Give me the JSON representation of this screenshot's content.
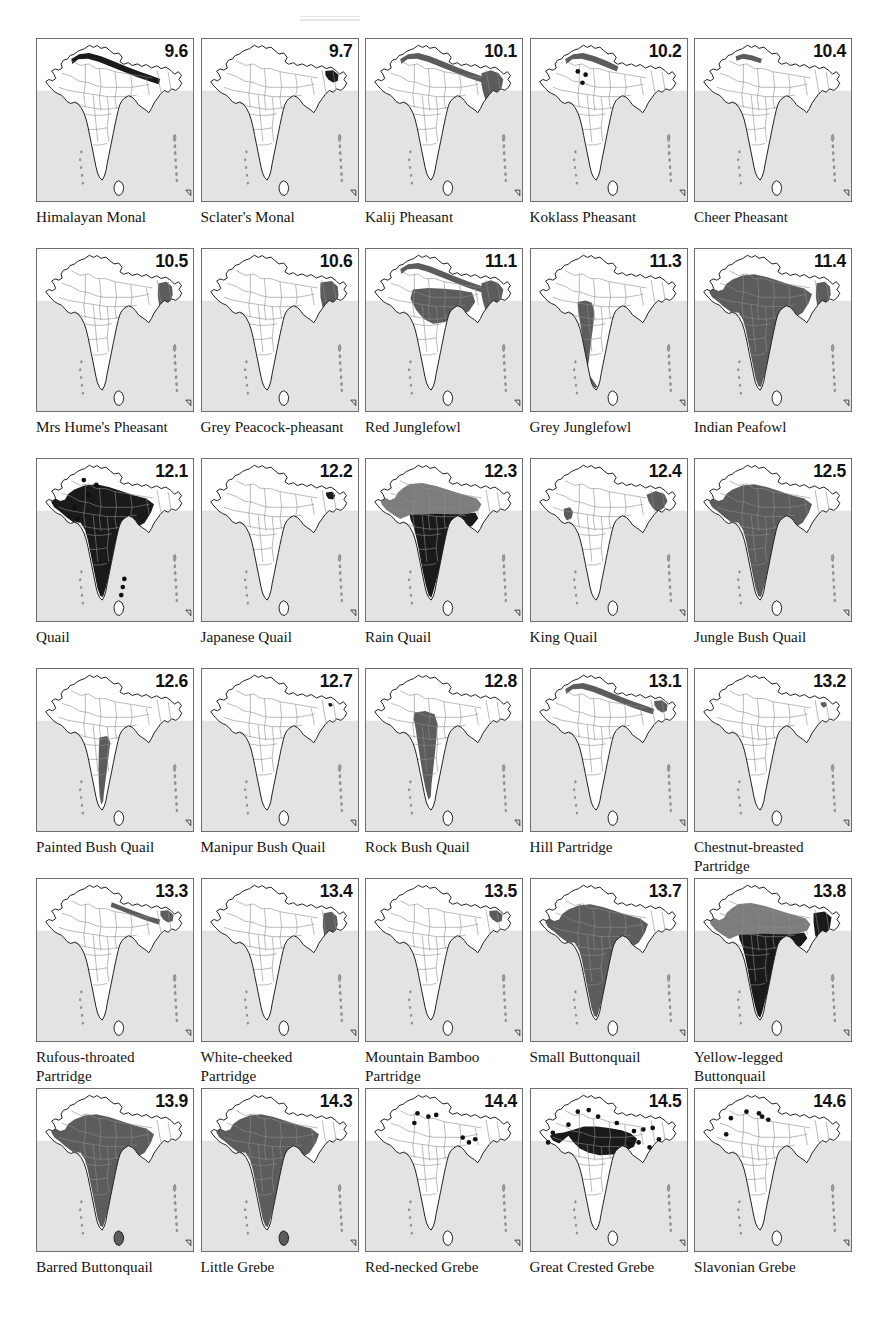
{
  "figure": {
    "type": "map-plate",
    "title_marks": "faint printer registration marks at top",
    "columns": 5,
    "rows": 6,
    "map_subject": "Distribution maps of the Indian subcontinent",
    "colors": {
      "sea": "#e3e3e3",
      "land": "#ffffff",
      "outline": "#1b1b1b",
      "state_border": "#8c8c8c",
      "range_light": "#7d7d7d",
      "range_mid": "#5c5c5c",
      "range_dark": "#1a1a1a",
      "panel_border": "#6e6e6e",
      "number": "#121212"
    }
  },
  "panels": [
    {
      "number": "9.6",
      "name": "Himalayan Monal",
      "shade": "none",
      "regions": [
        "himalaya-band"
      ],
      "dots": []
    },
    {
      "number": "9.7",
      "name": "Sclater's Monal",
      "shade": "none",
      "regions": [
        "ne-hills"
      ],
      "dots": []
    },
    {
      "number": "10.1",
      "name": "Kalij Pheasant",
      "shade": "mid",
      "regions": [
        "himalaya-band",
        "ne-block"
      ],
      "dots": []
    },
    {
      "number": "10.2",
      "name": "Koklass Pheasant",
      "shade": "mid",
      "regions": [
        "himalaya-west-band"
      ],
      "dots": [
        [
          0.3,
          0.2
        ],
        [
          0.35,
          0.22
        ],
        [
          0.33,
          0.27
        ]
      ]
    },
    {
      "number": "10.4",
      "name": "Cheer Pheasant",
      "shade": "mid",
      "regions": [
        "himalaya-west-short"
      ],
      "dots": []
    },
    {
      "number": "10.5",
      "name": "Mrs Hume's Pheasant",
      "shade": "mid",
      "regions": [
        "ne-strip"
      ],
      "dots": []
    },
    {
      "number": "10.6",
      "name": "Grey Peacock-pheasant",
      "shade": "mid",
      "regions": [
        "ne-strip-wide"
      ],
      "dots": []
    },
    {
      "number": "11.1",
      "name": "Red Junglefowl",
      "shade": "mid",
      "regions": [
        "himalaya-band",
        "ne-block",
        "central"
      ],
      "dots": []
    },
    {
      "number": "11.3",
      "name": "Grey Junglefowl",
      "shade": "mid",
      "regions": [
        "peninsula-west"
      ],
      "dots": []
    },
    {
      "number": "11.4",
      "name": "Indian Peafowl",
      "shade": "mid",
      "regions": [
        "india-main",
        "ne-strip"
      ],
      "dots": []
    },
    {
      "number": "12.1",
      "name": "Quail",
      "shade": "dark",
      "regions": [
        "india-main"
      ],
      "dots": [
        [
          0.3,
          0.13
        ],
        [
          0.38,
          0.16
        ],
        [
          0.33,
          0.22
        ],
        [
          0.24,
          0.3
        ],
        [
          0.26,
          0.37
        ],
        [
          0.56,
          0.74
        ],
        [
          0.55,
          0.79
        ],
        [
          0.54,
          0.84
        ]
      ]
    },
    {
      "number": "12.2",
      "name": "Japanese Quail",
      "shade": "dark",
      "regions": [
        "ne-small"
      ],
      "dots": []
    },
    {
      "number": "12.3",
      "name": "Rain Quail",
      "shade": "two",
      "regions": [
        "north-light",
        "peninsula-dark"
      ],
      "dots": []
    },
    {
      "number": "12.4",
      "name": "King Quail",
      "shade": "mid",
      "regions": [
        "ne-arc",
        "west-strip"
      ],
      "dots": []
    },
    {
      "number": "12.5",
      "name": "Jungle Bush Quail",
      "shade": "mid",
      "regions": [
        "india-main"
      ],
      "dots": []
    },
    {
      "number": "12.6",
      "name": "Painted Bush Quail",
      "shade": "mid",
      "regions": [
        "peninsula-south-narrow"
      ],
      "dots": []
    },
    {
      "number": "12.7",
      "name": "Manipur Bush Quail",
      "shade": "none",
      "regions": [
        "ne-dot"
      ],
      "dots": []
    },
    {
      "number": "12.8",
      "name": "Rock Bush Quail",
      "shade": "mid",
      "regions": [
        "peninsula-central"
      ],
      "dots": []
    },
    {
      "number": "13.1",
      "name": "Hill Partridge",
      "shade": "mid",
      "regions": [
        "himalaya-band",
        "ne-hills"
      ],
      "dots": []
    },
    {
      "number": "13.2",
      "name": "Chestnut-breasted\nPartridge",
      "shade": "mid",
      "regions": [
        "ne-tiny"
      ],
      "dots": []
    },
    {
      "number": "13.3",
      "name": "Rufous-throated\nPartridge",
      "shade": "mid",
      "regions": [
        "himalaya-east",
        "ne-hills"
      ],
      "dots": []
    },
    {
      "number": "13.4",
      "name": "White-cheeked\nPartridge",
      "shade": "mid",
      "regions": [
        "ne-strip"
      ],
      "dots": []
    },
    {
      "number": "13.5",
      "name": "Mountain Bamboo\nPartridge",
      "shade": "mid",
      "regions": [
        "ne-hills"
      ],
      "dots": []
    },
    {
      "number": "13.7",
      "name": "Small Buttonquail",
      "shade": "mid",
      "regions": [
        "india-main"
      ],
      "dots": []
    },
    {
      "number": "13.8",
      "name": "Yellow-legged\nButtonquail",
      "shade": "two",
      "regions": [
        "north-light",
        "peninsula-dark",
        "ne-dark"
      ],
      "dots": []
    },
    {
      "number": "13.9",
      "name": "Barred Buttonquail",
      "shade": "mid",
      "regions": [
        "india-main",
        "sri-lanka"
      ],
      "dots": []
    },
    {
      "number": "14.3",
      "name": "Little Grebe",
      "shade": "mid",
      "regions": [
        "india-main",
        "sri-lanka"
      ],
      "dots": []
    },
    {
      "number": "14.4",
      "name": "Red-necked Grebe",
      "shade": "none",
      "regions": [],
      "dots": [
        [
          0.33,
          0.15
        ],
        [
          0.4,
          0.17
        ],
        [
          0.45,
          0.16
        ],
        [
          0.31,
          0.21
        ],
        [
          0.62,
          0.3
        ],
        [
          0.66,
          0.33
        ],
        [
          0.7,
          0.31
        ]
      ]
    },
    {
      "number": "14.5",
      "name": "Great Crested Grebe",
      "shade": "dark",
      "regions": [
        "north-india-dark"
      ],
      "dots": [
        [
          0.3,
          0.14
        ],
        [
          0.37,
          0.13
        ],
        [
          0.43,
          0.17
        ],
        [
          0.24,
          0.22
        ],
        [
          0.14,
          0.27
        ],
        [
          0.11,
          0.33
        ],
        [
          0.55,
          0.21
        ],
        [
          0.66,
          0.26
        ],
        [
          0.72,
          0.25
        ],
        [
          0.78,
          0.24
        ],
        [
          0.63,
          0.34
        ],
        [
          0.69,
          0.33
        ],
        [
          0.82,
          0.31
        ],
        [
          0.76,
          0.36
        ]
      ]
    },
    {
      "number": "14.6",
      "name": "Slavonian Grebe",
      "shade": "none",
      "regions": [],
      "dots": [
        [
          0.33,
          0.14
        ],
        [
          0.41,
          0.15
        ],
        [
          0.43,
          0.17
        ],
        [
          0.47,
          0.19
        ],
        [
          0.23,
          0.18
        ],
        [
          0.2,
          0.28
        ]
      ]
    }
  ]
}
